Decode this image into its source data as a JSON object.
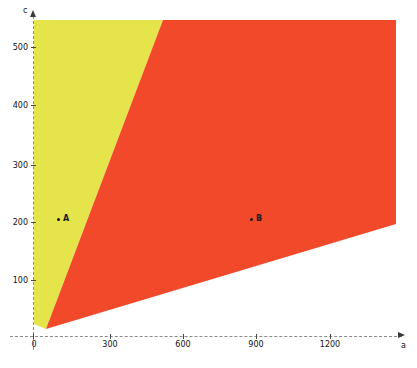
{
  "chart_data": {
    "type": "area",
    "title": "",
    "xlabel": "a",
    "ylabel": "c",
    "xlim": [
      -100,
      1500
    ],
    "ylim": [
      -35,
      560
    ],
    "grid": false,
    "legend": "none",
    "x_ticks": [
      {
        "value": 0,
        "label": "0"
      },
      {
        "value": 300,
        "label": "300"
      },
      {
        "value": 600,
        "label": "600"
      },
      {
        "value": 900,
        "label": "900"
      },
      {
        "value": 1200,
        "label": "1200"
      }
    ],
    "y_ticks": [
      {
        "value": 100,
        "label": "100"
      },
      {
        "value": 200,
        "label": "200"
      },
      {
        "value": 300,
        "label": "300"
      },
      {
        "value": 400,
        "label": "400"
      },
      {
        "value": 500,
        "label": "500"
      }
    ],
    "regions": [
      {
        "name": "yellow-region",
        "color": "#e5e54b",
        "polygon_px": "46,329 163,20 34,20 34,324"
      },
      {
        "name": "orange-region",
        "color": "#f2492a",
        "polygon_px": "46,329 163,20 396,20 396,224"
      }
    ],
    "points": [
      {
        "name": "A",
        "label": "A",
        "x": 110,
        "y": 200,
        "px": 57,
        "py": 218
      },
      {
        "name": "B",
        "label": "B",
        "x": 900,
        "y": 200,
        "px": 250,
        "py": 218
      }
    ],
    "axis_colors": {
      "axis_line": "#8a8a8a",
      "tick": "#4a4a4a",
      "text": "#111111",
      "yellow": "#e5e54b",
      "orange": "#f2492a"
    },
    "tick_pixels": {
      "x": {
        "0": 34,
        "300": 110,
        "600": 183,
        "900": 256,
        "1200": 330
      },
      "y": {
        "100": 280,
        "200": 222,
        "300": 165,
        "400": 105,
        "500": 47
      }
    }
  }
}
